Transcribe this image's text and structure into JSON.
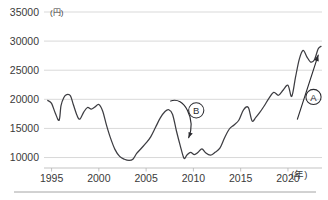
{
  "chart_data": {
    "type": "line",
    "title": "",
    "subtitle": "",
    "xlabel": "(年)",
    "ylabel": "(円)",
    "y_unit": "(円)",
    "x_unit": "(年)",
    "grid": true,
    "legend": "none",
    "xlim": [
      1994.2,
      2023.6
    ],
    "ylim": [
      8200,
      35000
    ],
    "yticks": [
      10000,
      15000,
      20000,
      25000,
      30000,
      35000
    ],
    "ytick_labels": [
      "10000",
      "15000",
      "20000",
      "25000",
      "30000",
      "35000"
    ],
    "xticks": [
      1995,
      2000,
      2005,
      2010,
      2015,
      2020
    ],
    "xtick_labels": [
      "1995",
      "2000",
      "2005",
      "2010",
      "2015",
      "2020"
    ],
    "series": [
      {
        "name": "株価",
        "color": "#3d3d42",
        "x": [
          1994.6,
          1995.0,
          1995.4,
          1995.8,
          1996.0,
          1996.3,
          1996.6,
          1997.0,
          1997.3,
          1997.7,
          1998.0,
          1998.4,
          1998.8,
          1999.2,
          1999.6,
          2000.0,
          2000.4,
          2000.8,
          2001.2,
          2001.7,
          2002.2,
          2002.7,
          2003.2,
          2003.6,
          2004.0,
          2004.5,
          2005.0,
          2005.5,
          2006.0,
          2006.5,
          2007.0,
          2007.4,
          2007.8,
          2008.2,
          2008.6,
          2009.0,
          2009.3,
          2009.7,
          2010.1,
          2010.5,
          2010.9,
          2011.3,
          2011.8,
          2012.3,
          2012.8,
          2013.3,
          2013.8,
          2014.3,
          2014.8,
          2015.3,
          2015.8,
          2016.2,
          2016.6,
          2017.0,
          2017.5,
          2018.0,
          2018.5,
          2019.0,
          2019.5,
          2020.0,
          2020.4,
          2020.8,
          2021.2,
          2021.6,
          2022.0,
          2022.4,
          2022.8,
          2023.2,
          2023.5
        ],
        "y": [
          19800,
          19300,
          17600,
          16400,
          18900,
          20300,
          20800,
          20600,
          19100,
          17200,
          16600,
          17800,
          18600,
          18300,
          18700,
          19100,
          18000,
          15600,
          13500,
          11400,
          10200,
          9700,
          9500,
          9700,
          10700,
          11600,
          12500,
          13600,
          15200,
          16800,
          17900,
          18200,
          17400,
          14600,
          12100,
          9900,
          10400,
          10900,
          10500,
          10900,
          11500,
          10800,
          10400,
          10900,
          11600,
          13400,
          14900,
          15600,
          16400,
          18200,
          18600,
          16300,
          16900,
          17700,
          18900,
          20200,
          21200,
          20700,
          21600,
          22400,
          20500,
          23800,
          26900,
          28400,
          27300,
          26400,
          26800,
          28700,
          29100
        ]
      }
    ],
    "annotations": [
      {
        "id": "A",
        "label": "A",
        "kind": "circled-letter-with-arrow",
        "meaning": "上昇トレンド",
        "arrow_from": [
          2021.0,
          16600
        ],
        "arrow_to": [
          2023.2,
          27600
        ],
        "circle_at": [
          2022.7,
          20400
        ]
      },
      {
        "id": "B",
        "label": "B",
        "kind": "circled-letter-with-arrow",
        "meaning": "急落",
        "arrow_from": [
          2007.6,
          19700
        ],
        "arrow_to": [
          2009.5,
          13400
        ],
        "circle_at": [
          2010.3,
          18100
        ]
      }
    ]
  }
}
